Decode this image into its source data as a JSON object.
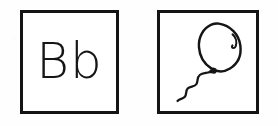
{
  "worksheet": {
    "title": "Letter Bb picture flashcard",
    "background_color": "#fefefe",
    "ink_color": "#141414",
    "cards": [
      {
        "id": "letter-card",
        "kind": "letter",
        "letter_pair": "Bb",
        "uppercase": "B",
        "lowercase": "b",
        "border_color": "#141414",
        "border_width_px": 3,
        "x": 20,
        "y": 10,
        "width": 99,
        "height": 104
      },
      {
        "id": "picture-card",
        "kind": "picture",
        "picture_name": "balloon",
        "picture_label": "balloon",
        "border_color": "#141414",
        "border_width_px": 3,
        "x": 157,
        "y": 10,
        "width": 102,
        "height": 104
      }
    ]
  },
  "drawing": {
    "name": "balloon",
    "style": "hand-drawn line art",
    "stroke_color": "#151515",
    "fill_color": "none",
    "parts": [
      {
        "name": "balloon-body",
        "shape": "oval",
        "stroke_width": 2.6
      },
      {
        "name": "balloon-highlight",
        "shape": "small hooked arc",
        "stroke_width": 2.2
      },
      {
        "name": "balloon-knot",
        "shape": "small triangle knot",
        "stroke_width": 2.4
      },
      {
        "name": "balloon-string",
        "shape": "wavy S curve",
        "stroke_width": 2.4
      }
    ]
  }
}
